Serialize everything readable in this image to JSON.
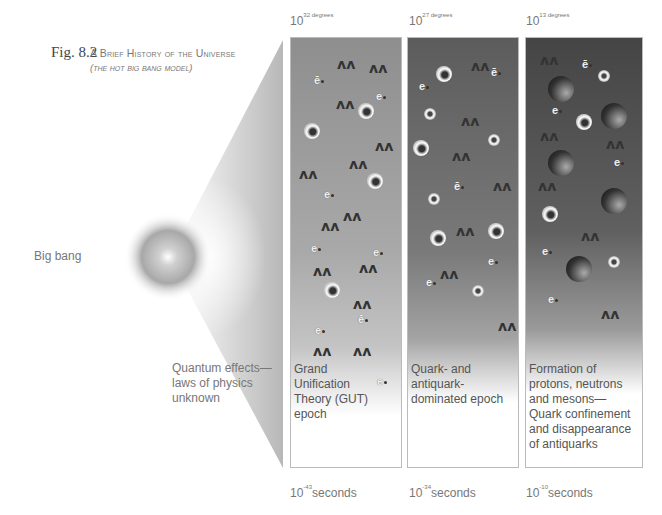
{
  "figure": {
    "number": "Fig. 8.2",
    "title": "A Brief History of the Universe",
    "subtitle": "(the hot big bang model)"
  },
  "left_labels": {
    "big_bang": "Big bang",
    "quantum": "Quantum effects— laws of physics unknown"
  },
  "panels": [
    {
      "temperature_base": "10",
      "temperature_exp": "32",
      "temperature_unit": "degrees",
      "time_base": "10",
      "time_exp": "-43",
      "time_unit": "seconds",
      "description": "Grand Unification Theory (GUT) epoch"
    },
    {
      "temperature_base": "10",
      "temperature_exp": "27",
      "temperature_unit": "degrees",
      "time_base": "10",
      "time_exp": "-34",
      "time_unit": "seconds",
      "description": "Quark- and antiquark-dominated epoch"
    },
    {
      "temperature_base": "10",
      "temperature_exp": "13",
      "temperature_unit": "degrees",
      "time_base": "10",
      "time_exp": "-10",
      "time_unit": "seconds",
      "description": "Formation of protons, neutrons and mesons— Quark confinement and disappearance of antiquarks"
    }
  ],
  "particle_symbols": {
    "electron": "e",
    "positron": "ē",
    "photon": "ʌʌ"
  },
  "colors": {
    "panel1_top": "#8e8e8e",
    "panel2_top": "#5c5c5c",
    "panel3_top": "#454545",
    "text": "#777777"
  }
}
